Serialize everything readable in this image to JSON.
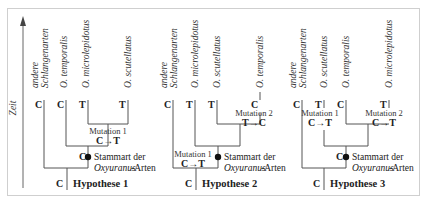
{
  "axis": {
    "label": "Zeit"
  },
  "node_label": {
    "line1": "Stammart der",
    "line2_italic": "Oxyuranus",
    "line2_rest": "-Arten"
  },
  "hypotheses": [
    {
      "title": "Hypothese 1",
      "root_base": "C",
      "node_base": "C",
      "taxa": [
        {
          "line1": "andere",
          "line2": "Schlangenarten",
          "base": "C"
        },
        {
          "line1": "O. temporalis",
          "base": "C"
        },
        {
          "line1": "O. microlepidotus",
          "base": "T"
        },
        {
          "line1": "O. scutellatus",
          "base": "T"
        }
      ],
      "mutations": [
        {
          "label": "Mutation 1",
          "change": "C→T"
        }
      ]
    },
    {
      "title": "Hypothese 2",
      "root_base": "C",
      "taxa": [
        {
          "line1": "andere",
          "line2": "Schlangenarten",
          "base": "C"
        },
        {
          "line1": "O. microlepidotus",
          "base": "T"
        },
        {
          "line1": "O. scutellatus",
          "base": "T"
        },
        {
          "line1": "O. temporalis",
          "base": "C"
        }
      ],
      "mutations": [
        {
          "label": "Mutation 1",
          "change": "C→T"
        },
        {
          "label": "Mutation 2",
          "change": "T→C"
        }
      ]
    },
    {
      "title": "Hypothese 3",
      "root_base": "C",
      "node_base": "C",
      "taxa": [
        {
          "line1": "andere",
          "line2": "Schlangenarten",
          "base": "C"
        },
        {
          "line1": "O. scutellatus",
          "base": "T"
        },
        {
          "line1": "O. temporalis",
          "base": "C"
        },
        {
          "line1": "O. microlepidotus",
          "base": "T"
        }
      ],
      "mutations": [
        {
          "label": "Mutation 1",
          "change": "C→T"
        },
        {
          "label": "Mutation 2",
          "change": "C→T"
        }
      ]
    }
  ],
  "colors": {
    "line": "#555555",
    "text": "#222222",
    "frame": "#cfcfcf"
  }
}
